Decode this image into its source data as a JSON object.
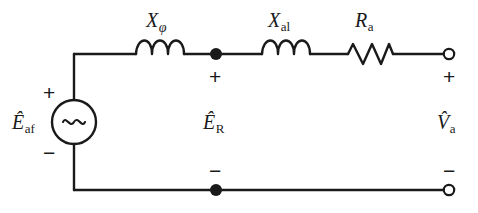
{
  "diagram": {
    "type": "electrical-schematic",
    "background_color": "#ffffff",
    "wire_color": "#1a1a1a",
    "text_color": "#1a1a1a"
  },
  "components": {
    "source": {
      "kind": "ac-voltage-source",
      "symbol": "~",
      "label_main": "E",
      "label_accent": "^",
      "label_sub": "af",
      "plus": "+",
      "minus": "−"
    },
    "inductor_1": {
      "kind": "inductor",
      "label_main": "X",
      "label_sub": "φ",
      "sub_style": "italic",
      "coils": 3
    },
    "inductor_2": {
      "kind": "inductor",
      "label_main": "X",
      "label_sub": "al",
      "sub_style": "roman",
      "coils": 3
    },
    "resistor_1": {
      "kind": "resistor",
      "label_main": "R",
      "label_sub": "a",
      "sub_style": "roman",
      "zigzags": 4
    }
  },
  "nodes": {
    "mid_top": {
      "kind": "junction-dot",
      "filled": true
    },
    "mid_bottom": {
      "kind": "junction-dot",
      "filled": true
    },
    "out_top": {
      "kind": "open-terminal",
      "filled": false
    },
    "out_bottom": {
      "kind": "open-terminal",
      "filled": false
    }
  },
  "voltages": {
    "middle": {
      "label_main": "E",
      "label_accent": "^",
      "label_sub": "R",
      "plus": "+",
      "minus": "−"
    },
    "output": {
      "label_main": "V",
      "label_accent": "^",
      "label_sub": "a",
      "plus": "+",
      "minus": "−"
    }
  }
}
